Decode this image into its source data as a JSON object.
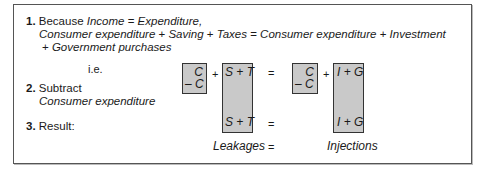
{
  "steps": [
    {
      "number": "1.",
      "lead": "Because ",
      "eq_left": "Income",
      "eq_sign": " = ",
      "eq_right": "Expenditure,",
      "line2": {
        "a": "Consumer expenditure",
        "p1": " + ",
        "b": "Saving",
        "p2": " + ",
        "c": "Taxes",
        "eq": " = ",
        "d": "Consumer expenditure",
        "p3": " + ",
        "e": "Investment"
      },
      "line3": {
        "p": "+ ",
        "a": "Government purchases"
      }
    },
    {
      "ie": "i.e.",
      "number": "2.",
      "label": "Subtract",
      "sublabel": "Consumer expenditure"
    },
    {
      "number": "3.",
      "label": "Result:"
    }
  ],
  "diagram": {
    "left_c_top": "C",
    "left_c_bottom": "– C",
    "plus1": "+",
    "st_top": "S + T",
    "st_bottom": "S + T",
    "equals1": "=",
    "equals2": "=",
    "right_c_top": "C",
    "right_c_bottom": "– C",
    "plus2": "+",
    "ig_top": "I + G",
    "ig_bottom": "I + G",
    "leakages": "Leakages",
    "equals3": "=",
    "injections": "Injections"
  }
}
